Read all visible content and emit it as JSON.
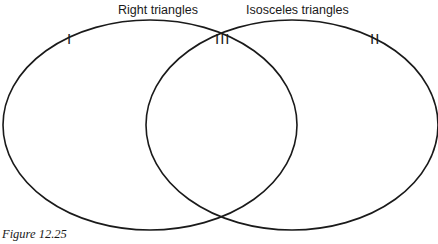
{
  "diagram": {
    "type": "venn",
    "sets": [
      {
        "label": "Right triangles",
        "region_label": "I"
      },
      {
        "label": "Isosceles triangles",
        "region_label": "II"
      }
    ],
    "intersection_label": "III",
    "caption": "Figure 12.25",
    "stroke_color": "#1a1a1a"
  }
}
